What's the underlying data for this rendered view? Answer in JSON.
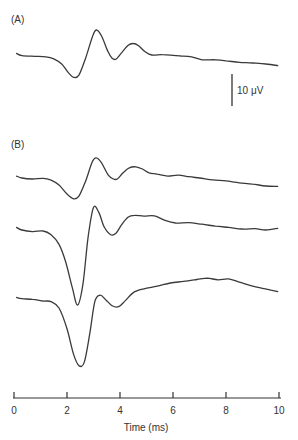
{
  "chart_data": {
    "type": "line",
    "title": "",
    "xlabel": "Time (ms)",
    "ylabel": "",
    "xlim": [
      0,
      10
    ],
    "xticks": [
      0,
      2,
      4,
      6,
      8,
      10
    ],
    "xtick_labels": [
      "0",
      "2",
      "4",
      "6",
      "8",
      "10"
    ],
    "grid": false,
    "scale_bar": {
      "label": "10 μV",
      "value_uV": 10
    },
    "panels": [
      {
        "label": "(A)",
        "series": [
          {
            "name": "A",
            "x": [
              0.1,
              0.3,
              0.8,
              1.2,
              1.5,
              1.8,
              2.05,
              2.25,
              2.45,
              2.7,
              2.95,
              3.1,
              3.3,
              3.55,
              3.7,
              3.85,
              4.05,
              4.3,
              4.5,
              4.7,
              4.95,
              5.2,
              5.6,
              6.0,
              6.3,
              6.7,
              7.1,
              7.6,
              8.0,
              8.5,
              9.0,
              9.5,
              9.95
            ],
            "y": [
              0.5,
              -0.2,
              -0.4,
              -0.6,
              -1.2,
              -2.8,
              -5.5,
              -7.0,
              -6.3,
              -1.0,
              5.5,
              7.8,
              6.0,
              1.0,
              -1.0,
              -1.3,
              0.6,
              3.0,
              3.6,
              2.9,
              1.0,
              0.0,
              0.1,
              -0.1,
              -0.3,
              -0.6,
              -1.5,
              -1.5,
              -1.8,
              -2.3,
              -2.5,
              -2.8,
              -3.3
            ]
          }
        ]
      },
      {
        "label": "(B)",
        "series": [
          {
            "name": "B1",
            "x": [
              0.1,
              0.3,
              0.7,
              1.1,
              1.4,
              1.7,
              2.0,
              2.25,
              2.45,
              2.7,
              2.95,
              3.1,
              3.3,
              3.55,
              3.75,
              3.9,
              4.1,
              4.35,
              4.6,
              4.85,
              5.1,
              5.4,
              5.8,
              6.2,
              6.6,
              7.0,
              7.5,
              8.0,
              8.5,
              9.0,
              9.5,
              9.95
            ],
            "y": [
              0.6,
              0.0,
              -0.3,
              -0.1,
              -0.7,
              -2.2,
              -5.0,
              -6.5,
              -5.7,
              -1.0,
              5.0,
              6.3,
              4.8,
              1.0,
              -0.3,
              -0.3,
              1.5,
              3.2,
              3.5,
              2.8,
              1.6,
              1.2,
              0.6,
              0.9,
              0.4,
              0.0,
              -0.6,
              -0.9,
              -1.5,
              -1.9,
              -2.5,
              -2.6
            ]
          },
          {
            "name": "B2",
            "x": [
              0.1,
              0.3,
              0.7,
              1.1,
              1.4,
              1.7,
              1.95,
              2.2,
              2.4,
              2.6,
              2.8,
              3.0,
              3.2,
              3.4,
              3.65,
              3.85,
              4.05,
              4.3,
              4.55,
              4.9,
              5.3,
              5.7,
              6.1,
              6.6,
              7.1,
              7.6,
              8.1,
              8.6,
              9.1,
              9.5,
              9.95
            ],
            "y": [
              0.8,
              0.0,
              -0.5,
              -0.3,
              -1.5,
              -4.5,
              -10.0,
              -18.0,
              -23.5,
              -17.0,
              -2.0,
              7.0,
              5.5,
              1.0,
              -1.5,
              -1.0,
              1.5,
              4.0,
              4.6,
              4.3,
              4.4,
              3.0,
              2.2,
              2.3,
              1.8,
              1.2,
              0.8,
              0.3,
              0.4,
              0.0,
              0.5
            ]
          },
          {
            "name": "B3",
            "x": [
              0.1,
              0.3,
              0.7,
              1.1,
              1.4,
              1.7,
              2.0,
              2.25,
              2.45,
              2.65,
              2.85,
              3.05,
              3.25,
              3.45,
              3.7,
              3.95,
              4.2,
              4.5,
              4.9,
              5.4,
              5.9,
              6.4,
              6.9,
              7.3,
              7.7,
              8.1,
              8.5,
              8.9,
              9.3,
              9.7,
              9.95
            ],
            "y": [
              0.8,
              0.4,
              0.2,
              -0.3,
              -0.5,
              -2.5,
              -9.0,
              -17.0,
              -20.5,
              -19.5,
              -11.0,
              -0.5,
              1.5,
              0.2,
              -1.8,
              -2.1,
              -0.2,
              2.3,
              3.5,
              4.3,
              5.3,
              5.8,
              6.4,
              6.8,
              6.3,
              6.6,
              5.6,
              4.6,
              3.8,
              3.1,
              2.6
            ]
          }
        ]
      }
    ]
  }
}
